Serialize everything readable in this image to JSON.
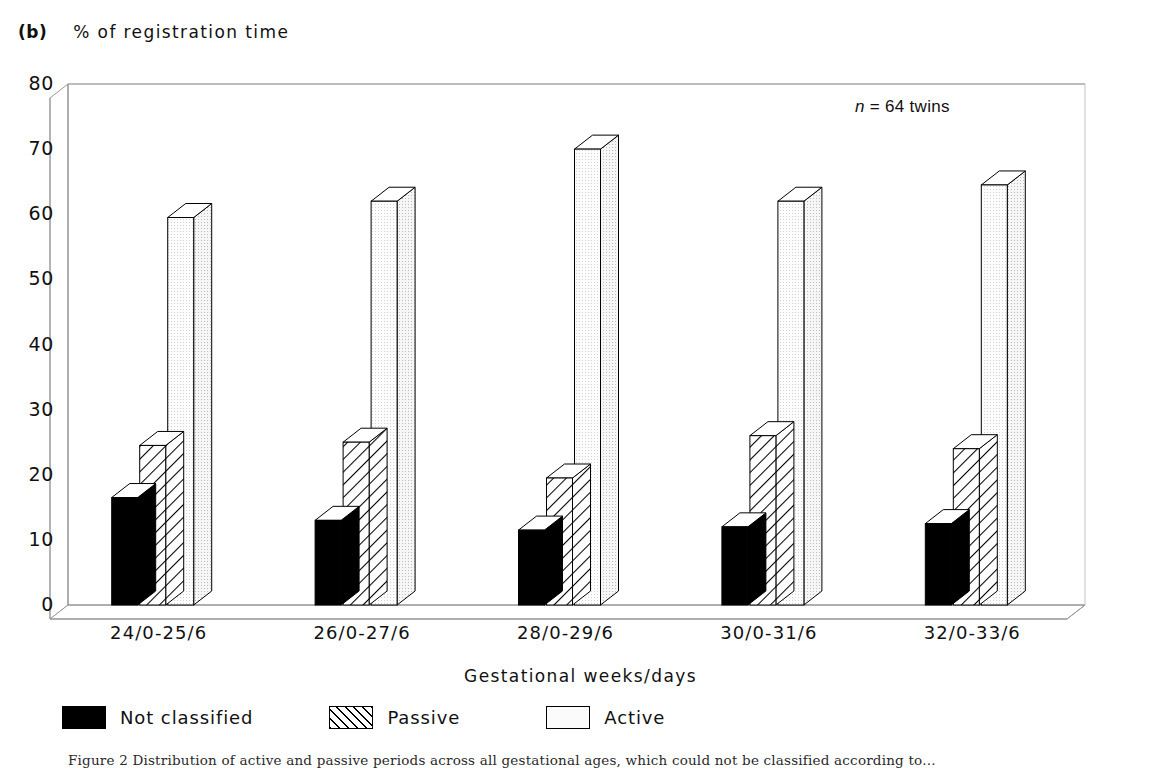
{
  "panel": {
    "letter": "(b)",
    "y_axis_caption": "% of registration time"
  },
  "annotation": {
    "n_symbol": "n",
    "n_text": " = 64 twins"
  },
  "axis_titles": {
    "x": "Gestational weeks/days"
  },
  "legend": {
    "entries": [
      {
        "label": "Not classified",
        "style": "solid",
        "color": "#000000"
      },
      {
        "label": "Passive",
        "style": "hatch",
        "color": "#ffffff"
      },
      {
        "label": "Active",
        "style": "light",
        "color": "#fbfbfb"
      }
    ]
  },
  "caption": "Figure 2  Distribution of active and passive periods across all gestational ages, which could not be classified according to...",
  "chart_data": {
    "type": "bar",
    "title": "% of registration time",
    "subtitle": "(b)",
    "xlabel": "Gestational weeks/days",
    "ylabel": "% of registration time",
    "ylim": [
      0,
      80
    ],
    "yticks": [
      0,
      10,
      20,
      30,
      40,
      50,
      60,
      70,
      80
    ],
    "grid": false,
    "legend_position": "bottom-left",
    "annotations": [
      "n = 64 twins"
    ],
    "categories": [
      "24/0-25/6",
      "26/0-27/6",
      "28/0-29/6",
      "30/0-31/6",
      "32/0-33/6"
    ],
    "series": [
      {
        "name": "Not classified",
        "values": [
          16.5,
          13.0,
          11.5,
          12.0,
          12.5
        ],
        "fill": "solid-black"
      },
      {
        "name": "Passive",
        "values": [
          24.5,
          25.0,
          19.5,
          26.0,
          24.0
        ],
        "fill": "diagonal-hatch"
      },
      {
        "name": "Active",
        "values": [
          59.5,
          62.0,
          70.0,
          62.0,
          64.5
        ],
        "fill": "light-stipple"
      }
    ]
  }
}
